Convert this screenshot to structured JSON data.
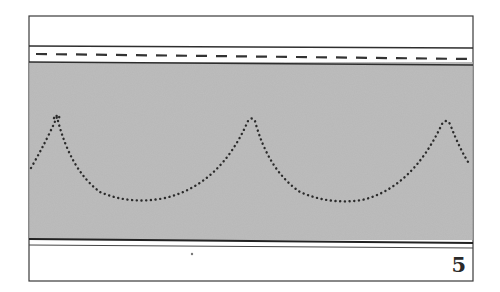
{
  "figure": {
    "type": "stitch-pattern-diagram",
    "page_number": "5",
    "bands": [
      {
        "name": "top-margin",
        "fill": "#ffffff"
      },
      {
        "name": "dashed-stitch-band",
        "fill": "#ffffff",
        "line_style": "dashed"
      },
      {
        "name": "textured-fabric-band",
        "fill": "#b8b8b8"
      },
      {
        "name": "bottom-margin",
        "fill": "#ffffff"
      }
    ],
    "scallop_curve": {
      "style": "dotted",
      "color": "#2b2b2b",
      "peaks": 3
    },
    "colors": {
      "frame": "#3a3a3a",
      "fabric": "#b8b8b8",
      "dots": "#2b2b2b"
    }
  }
}
